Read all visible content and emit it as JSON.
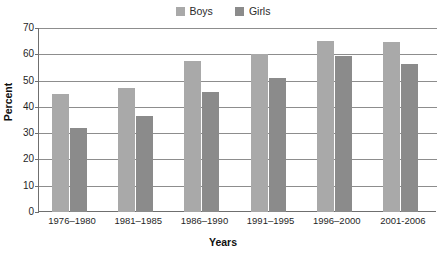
{
  "chart_data": {
    "type": "bar",
    "title": "",
    "xlabel": "Years",
    "ylabel": "Percent",
    "categories": [
      "1976–1980",
      "1981–1985",
      "1986–1990",
      "1991–1995",
      "1996–2000",
      "2001-2006"
    ],
    "series": [
      {
        "name": "Boys",
        "color": "#a9a9a9",
        "values": [
          45,
          47,
          57.5,
          60,
          65,
          64.5
        ]
      },
      {
        "name": "Girls",
        "color": "#8b8b8b",
        "values": [
          32,
          36.5,
          45.5,
          51,
          59.5,
          56.5
        ]
      }
    ],
    "ylim": [
      0,
      70
    ],
    "yticks": [
      0,
      10,
      20,
      30,
      40,
      50,
      60,
      70
    ],
    "ytick_labels": [
      "0",
      "10",
      "20",
      "30",
      "40",
      "50",
      "60",
      "70"
    ],
    "grid": true,
    "legend_position": "top-center",
    "axis_color": "#6f6f6f",
    "gridline_color": "#8d8d8d",
    "background": "#ffffff"
  },
  "legend": {
    "entries": [
      {
        "label": "Boys"
      },
      {
        "label": "Girls"
      }
    ]
  }
}
